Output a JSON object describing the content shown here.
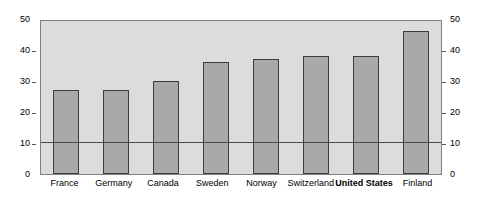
{
  "chart_data": {
    "type": "bar",
    "title": "",
    "subtitle": "",
    "xlabel": "",
    "ylabel": "",
    "categories": [
      "France",
      "Germany",
      "Canada",
      "Sweden",
      "Norway",
      "Switzerland",
      "United States",
      "Finland"
    ],
    "values": [
      27,
      27,
      30,
      36,
      37,
      38,
      38,
      46
    ],
    "highlighted_category": "United States",
    "ylim": [
      0,
      50
    ],
    "yticks": [
      0,
      10,
      20,
      30,
      40,
      50
    ],
    "left_axis_ticks": [
      "0",
      "10",
      "20",
      "30",
      "40",
      "50"
    ],
    "right_axis_ticks": [
      "0",
      "10",
      "20",
      "30",
      "40",
      "50"
    ],
    "dual_axis": true,
    "grid": false,
    "legend": null,
    "reference_lines": [
      {
        "value": 10,
        "label": ""
      }
    ],
    "annotations": [],
    "colors": {
      "bar_fill": "#a9a9a9",
      "bar_border": "#3c3c3c",
      "plot_background": "#dcdcdc",
      "plot_border": "#808080",
      "reference_line": "#4a4a4a",
      "text": "#000000",
      "page_background": "#ffffff"
    }
  }
}
